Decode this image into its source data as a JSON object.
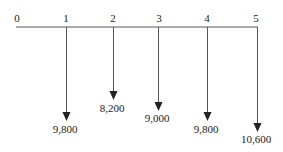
{
  "diagram": {
    "type": "cash-flow-timeline",
    "periods": [
      "0",
      "1",
      "2",
      "3",
      "4",
      "5"
    ],
    "cash_flows": [
      {
        "period": "1",
        "amount": "9,800",
        "direction": "down"
      },
      {
        "period": "2",
        "amount": "8,200",
        "direction": "down"
      },
      {
        "period": "3",
        "amount": "9,000",
        "direction": "down"
      },
      {
        "period": "4",
        "amount": "9,800",
        "direction": "down"
      },
      {
        "period": "5",
        "amount": "10,600",
        "direction": "down"
      }
    ],
    "line_color": "#555555"
  }
}
